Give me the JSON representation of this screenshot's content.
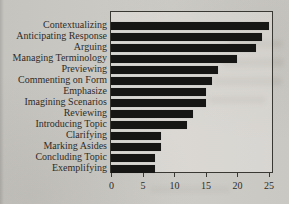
{
  "page": {
    "background": "#ceccc7",
    "text_color": "#2e2c28"
  },
  "chart_data": {
    "type": "bar",
    "orientation": "horizontal",
    "title": "",
    "xlabel": "",
    "ylabel": "",
    "categories": [
      "Contextualizing",
      "Anticipating Response",
      "Arguing",
      "Managing Terminology",
      "Previewing",
      "Commenting on Form",
      "Emphasize",
      "Imagining Scenarios",
      "Reviewing",
      "Introducing Topic",
      "Clarifying",
      "Marking Asides",
      "Concluding Topic",
      "Exemplifying"
    ],
    "values": [
      25,
      24,
      23,
      20,
      17,
      16,
      15,
      15,
      13,
      12,
      8,
      8,
      7,
      7
    ],
    "xlim": [
      0,
      25
    ],
    "xticks": [
      0,
      5,
      10,
      15,
      20,
      25
    ],
    "grid": false,
    "legend": false,
    "bar_color": "#161614",
    "frame_color": "#3a3832"
  }
}
